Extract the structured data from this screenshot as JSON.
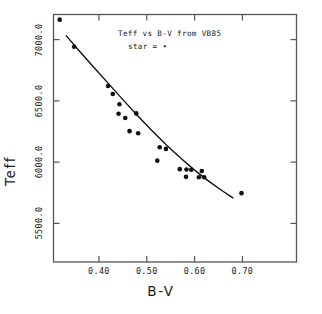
{
  "chart_data": {
    "type": "scatter",
    "title": "Teff vs B-V from VB85",
    "annotation": "star = •",
    "xlabel": "B-V",
    "ylabel": "Teff",
    "xlim": [
      0.305,
      0.813
    ],
    "ylim": [
      5185,
      7205
    ],
    "grid": false,
    "legend_position": "none",
    "xticks": [
      0.4,
      0.5,
      0.6,
      0.7
    ],
    "xtick_labels": [
      "0.40",
      "0.50",
      "0.60",
      "0.70"
    ],
    "yticks": [
      5500.0,
      6000.0,
      6500.0,
      7000.0
    ],
    "ytick_labels": [
      "5500.0",
      "6000.0",
      "6500.0",
      "7000.0"
    ],
    "series": [
      {
        "name": "star",
        "marker": "filled-circle",
        "color": "#101010",
        "points": [
          {
            "x": 0.318,
            "y": 7163
          },
          {
            "x": 0.348,
            "y": 6942
          },
          {
            "x": 0.419,
            "y": 6622
          },
          {
            "x": 0.429,
            "y": 6556
          },
          {
            "x": 0.443,
            "y": 6473
          },
          {
            "x": 0.441,
            "y": 6395
          },
          {
            "x": 0.455,
            "y": 6360
          },
          {
            "x": 0.478,
            "y": 6398
          },
          {
            "x": 0.464,
            "y": 6253
          },
          {
            "x": 0.482,
            "y": 6236
          },
          {
            "x": 0.527,
            "y": 6122
          },
          {
            "x": 0.54,
            "y": 6108
          },
          {
            "x": 0.522,
            "y": 6012
          },
          {
            "x": 0.569,
            "y": 5943
          },
          {
            "x": 0.583,
            "y": 5940
          },
          {
            "x": 0.593,
            "y": 5938
          },
          {
            "x": 0.615,
            "y": 5928
          },
          {
            "x": 0.582,
            "y": 5880
          },
          {
            "x": 0.609,
            "y": 5877
          },
          {
            "x": 0.62,
            "y": 5877
          },
          {
            "x": 0.698,
            "y": 5747
          }
        ]
      }
    ],
    "fit_curve": {
      "name": "relation",
      "color": "#101010",
      "points": [
        {
          "x": 0.331,
          "y": 7035
        },
        {
          "x": 0.36,
          "y": 6903
        },
        {
          "x": 0.39,
          "y": 6770
        },
        {
          "x": 0.42,
          "y": 6641
        },
        {
          "x": 0.45,
          "y": 6510
        },
        {
          "x": 0.48,
          "y": 6383
        },
        {
          "x": 0.51,
          "y": 6260
        },
        {
          "x": 0.54,
          "y": 6144
        },
        {
          "x": 0.57,
          "y": 6035
        },
        {
          "x": 0.6,
          "y": 5935
        },
        {
          "x": 0.63,
          "y": 5843
        },
        {
          "x": 0.66,
          "y": 5760
        },
        {
          "x": 0.672,
          "y": 5729
        },
        {
          "x": 0.681,
          "y": 5706
        }
      ]
    }
  },
  "axes": {
    "frame_color": "#4a4a4a"
  }
}
